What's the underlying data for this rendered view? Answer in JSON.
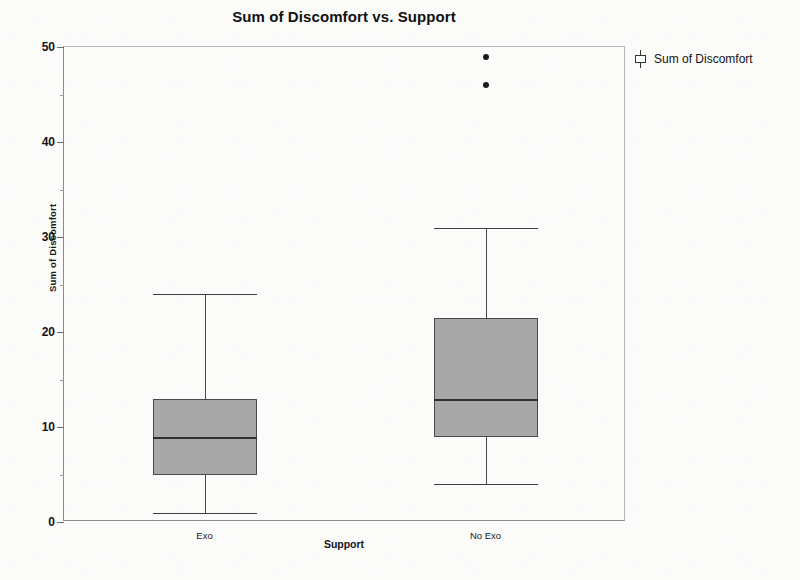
{
  "chart_data": {
    "type": "box",
    "title": "Sum of Discomfort vs. Support",
    "xlabel": "Support",
    "ylabel": "Sum of Discomfort",
    "categories": [
      "Exo",
      "No Exo"
    ],
    "ylim": [
      0,
      50
    ],
    "y_major_ticks": [
      0,
      10,
      20,
      30,
      40,
      50
    ],
    "y_tick_labels": [
      "0",
      "10",
      "20",
      "30",
      "40",
      "50"
    ],
    "y_minor_tick_step": 5,
    "grid": false,
    "legend": {
      "position": "right-top",
      "entries": [
        {
          "label": "Sum of Discomfort",
          "glyph": "boxplot-glyph"
        }
      ]
    },
    "box_fill_color": "#a8a8a8",
    "box_line_color": "#4a4a4a",
    "outlier_color": "#1a1a1a",
    "boxes": [
      {
        "category": "Exo",
        "lower_whisker": 1,
        "q1": 5,
        "median": 9,
        "q3": 13,
        "upper_whisker": 24,
        "outliers": []
      },
      {
        "category": "No Exo",
        "lower_whisker": 4,
        "q1": 9,
        "median": 13,
        "q3": 21.5,
        "upper_whisker": 31,
        "outliers": [
          46,
          49
        ]
      }
    ]
  }
}
